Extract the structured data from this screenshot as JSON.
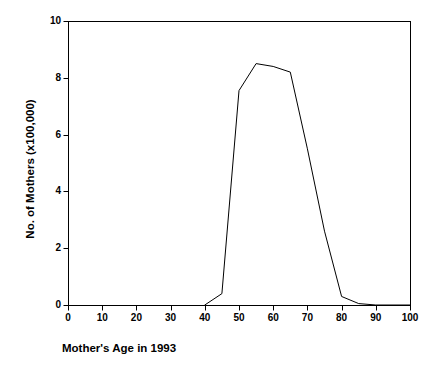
{
  "chart_data": {
    "type": "line",
    "title": "",
    "xlabel": "Mother's Age in 1993",
    "ylabel": "No. of Mothers (x100,000)",
    "xlim": [
      0,
      100
    ],
    "ylim": [
      0,
      10
    ],
    "grid": false,
    "legend": null,
    "x_ticks": [
      0,
      10,
      20,
      30,
      40,
      50,
      60,
      70,
      80,
      90,
      100
    ],
    "x_tick_labels": [
      "0",
      "10",
      "20",
      "30",
      "40",
      "50",
      "60",
      "70",
      "80",
      "90",
      "100"
    ],
    "y_ticks": [
      0,
      2,
      4,
      6,
      8,
      10
    ],
    "y_tick_labels": [
      "0",
      "2",
      "4",
      "6",
      "8",
      "10"
    ],
    "line_color": "#000000",
    "line_width": 1,
    "series": [
      {
        "name": "No. of Mothers",
        "x": [
          40,
          45,
          50,
          55,
          60,
          65,
          70,
          75,
          80,
          85,
          90,
          100
        ],
        "values": [
          0,
          0.4,
          7.55,
          8.5,
          8.4,
          8.2,
          5.5,
          2.6,
          0.3,
          0.05,
          0,
          0
        ]
      }
    ]
  },
  "axes": {
    "frame_color": "#000000",
    "x_caption": "Mother's Age in 1993",
    "y_caption": "No. of Mothers (x100,000)"
  }
}
